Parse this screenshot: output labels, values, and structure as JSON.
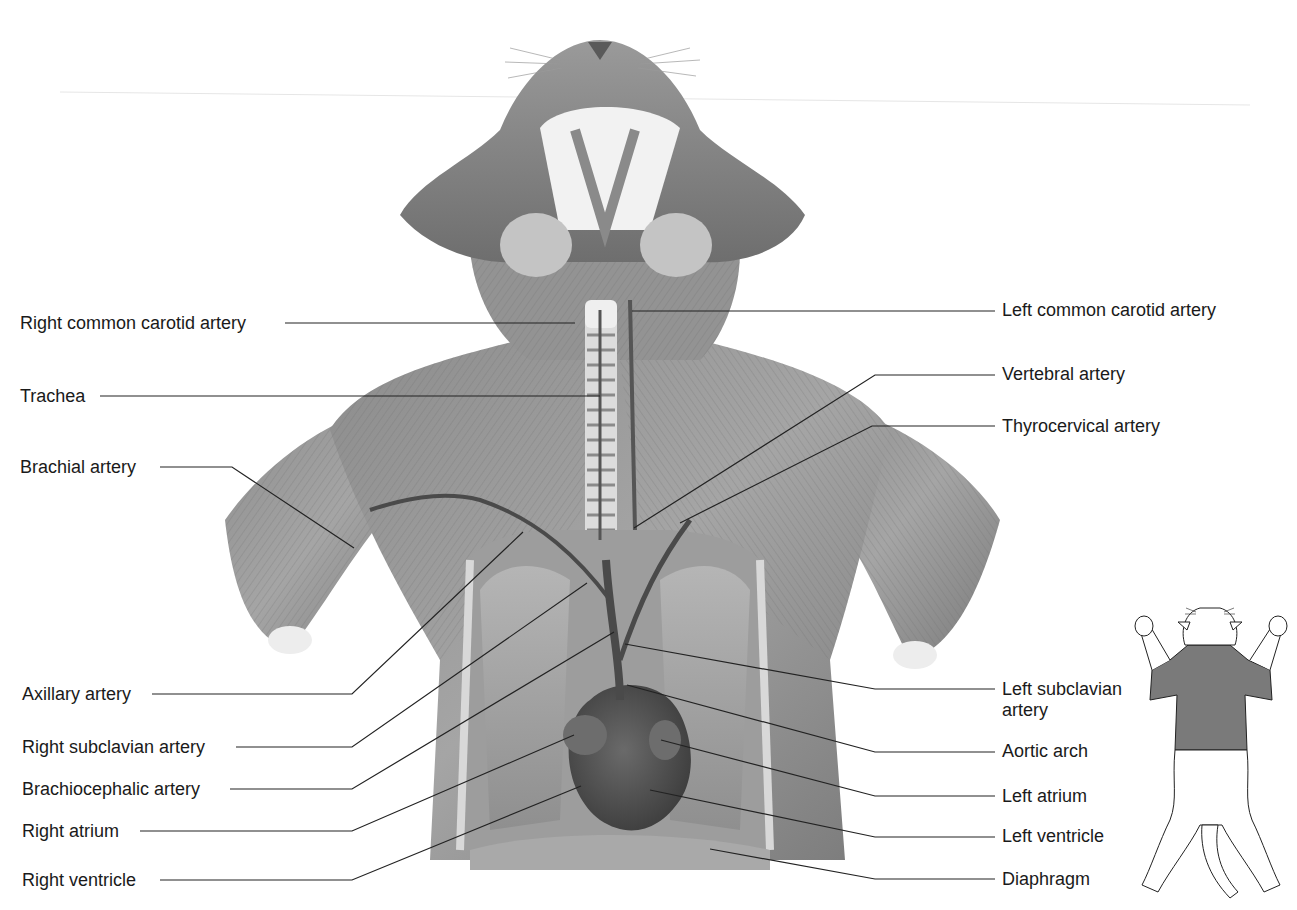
{
  "figure": {
    "colors": {
      "background": "#ffffff",
      "label_text": "#1a1a1a",
      "leader_line": "#222222",
      "inset_shade": "#7a7a7a"
    }
  },
  "labels_left": [
    {
      "id": "right-common-carotid-artery",
      "text": "Right common carotid artery"
    },
    {
      "id": "trachea",
      "text": "Trachea"
    },
    {
      "id": "brachial-artery",
      "text": "Brachial artery"
    },
    {
      "id": "axillary-artery",
      "text": "Axillary artery"
    },
    {
      "id": "right-subclavian-artery",
      "text": "Right subclavian artery"
    },
    {
      "id": "brachiocephalic-artery",
      "text": "Brachiocephalic artery"
    },
    {
      "id": "right-atrium",
      "text": "Right atrium"
    },
    {
      "id": "right-ventricle",
      "text": "Right ventricle"
    }
  ],
  "labels_right": [
    {
      "id": "left-common-carotid-artery",
      "text": "Left common carotid artery"
    },
    {
      "id": "vertebral-artery",
      "text": "Vertebral artery"
    },
    {
      "id": "thyrocervical-artery",
      "text": "Thyrocervical artery"
    },
    {
      "id": "left-subclavian-artery",
      "text": "Left subclavian artery"
    },
    {
      "id": "aortic-arch",
      "text": "Aortic arch"
    },
    {
      "id": "left-atrium",
      "text": "Left atrium"
    },
    {
      "id": "left-ventricle",
      "text": "Left ventricle"
    },
    {
      "id": "diaphragm",
      "text": "Diaphragm"
    }
  ],
  "inset": {
    "description": "Orientation outline of cat, ventral view, thoracic region shaded"
  }
}
